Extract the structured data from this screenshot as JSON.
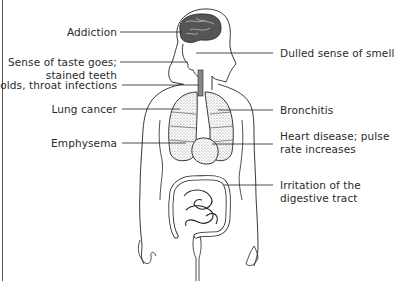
{
  "diagram": {
    "left_labels": [
      {
        "id": "addiction",
        "lines": [
          "Addiction"
        ],
        "organ": "brain"
      },
      {
        "id": "taste",
        "lines": [
          "Sense of taste goes;",
          "stained teeth"
        ],
        "organ": "mouth"
      },
      {
        "id": "colds",
        "lines": [
          "Colds, throat infections"
        ],
        "organ": "throat"
      },
      {
        "id": "lung-cancer",
        "lines": [
          "Lung cancer"
        ],
        "organ": "lungs"
      },
      {
        "id": "emphysema",
        "lines": [
          "Emphysema"
        ],
        "organ": "lungs"
      }
    ],
    "right_labels": [
      {
        "id": "smell",
        "lines": [
          "Dulled sense of smell"
        ],
        "organ": "nose"
      },
      {
        "id": "bronchitis",
        "lines": [
          "Bronchitis"
        ],
        "organ": "bronchi"
      },
      {
        "id": "heart",
        "lines": [
          "Heart disease; pulse",
          "rate increases"
        ],
        "organ": "heart"
      },
      {
        "id": "digestive",
        "lines": [
          "Irritation of the",
          "digestive tract"
        ],
        "organ": "intestines"
      }
    ],
    "colors": {
      "background": "#ffffff",
      "line": "#222222",
      "text": "#2a2a2a",
      "organ_shade": "#6a6a6a"
    }
  }
}
